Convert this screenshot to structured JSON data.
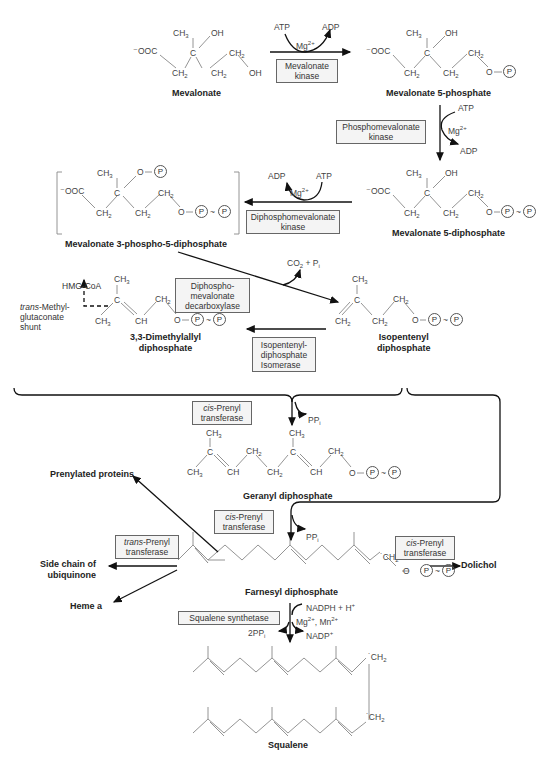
{
  "compounds": {
    "mevalonate": "Mevalonate",
    "mevalonate_5p": "Mevalonate 5-phosphate",
    "mevalonate_5pp": "Mevalonate 5-diphosphate",
    "mevalonate_3p5pp": "Mevalonate 3-phospho-5-diphosphate",
    "dmapp_1": "3,3-Dimethylallyl",
    "dmapp_2": "diphosphate",
    "ipp_1": "Isopentenyl",
    "ipp_2": "diphosphate",
    "gpp": "Geranyl diphosphate",
    "fpp": "Farnesyl diphosphate",
    "squalene": "Squalene"
  },
  "enzymes": {
    "mevalonate_kinase": [
      "Mevalonate",
      "kinase"
    ],
    "phosphomevalonate_kinase": [
      "Phosphomevalonate",
      "kinase"
    ],
    "diphosphomevalonate_kinase": [
      "Diphosphomevalonate",
      "kinase"
    ],
    "decarboxylase": [
      "Diphospho-",
      "mevalonate",
      "decarboxylase"
    ],
    "isomerase": [
      "Isopentenyl-",
      "diphosphate",
      "Isomerase"
    ],
    "cis_prenyl_1": {
      "italic": "cis",
      "rest": "-Prenyl",
      "line2": "transferase"
    },
    "cis_prenyl_2": {
      "italic": "cis",
      "rest": "-Prenyl",
      "line2": "transferase"
    },
    "cis_prenyl_3": {
      "italic": "cis",
      "rest": "-Prenyl",
      "line2": "transferase"
    },
    "trans_prenyl": {
      "italic": "trans",
      "rest": "-Prenyl",
      "line2": "transferase"
    },
    "squalene_synthetase": "Squalene synthetase"
  },
  "cofactors": {
    "atp": "ATP",
    "adp": "ADP",
    "mg": "Mg",
    "mg_charge": "2+",
    "co2_pi": "CO",
    "ppi": "PP",
    "two_ppi": "2PP",
    "nadph": "NADPH + H",
    "nadp": "NADP",
    "mg_mn": "Mg",
    "mn": ", Mn"
  },
  "side_products": {
    "prenylated_proteins": "Prenylated proteins",
    "ubiquinone_1": "Side chain of",
    "ubiquinone_2": "ubiquinone",
    "heme_a": "Heme a",
    "dolichol": "Dolichol",
    "hmg_coa": "HMG-CoA",
    "shunt_italic": "trans",
    "shunt_1": "-Methyl-",
    "shunt_2": "glutaconate",
    "shunt_3": "shunt"
  },
  "atoms": {
    "ch3": "CH",
    "ch2": "CH",
    "ch": "CH",
    "oh": "OH",
    "c": "C",
    "o": "O",
    "ooc": "OOC",
    "p": "P",
    "tilde": "~",
    "dash": "—"
  }
}
